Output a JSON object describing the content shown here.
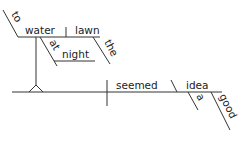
{
  "diagram": {
    "type": "sentence-diagram (Reed-Kellogg)",
    "colors": {
      "line": "#333333",
      "text": "#222222",
      "background": "#ffffff"
    },
    "subject_phrase": {
      "infinitive_marker": "to",
      "verb": "water",
      "object": "lawn",
      "object_modifier": "the",
      "prepositional_phrase": {
        "preposition": "at",
        "object": "night"
      }
    },
    "predicate": {
      "verb": "seemed",
      "predicate_nominative": "idea",
      "modifiers": [
        "a",
        "good"
      ]
    }
  }
}
